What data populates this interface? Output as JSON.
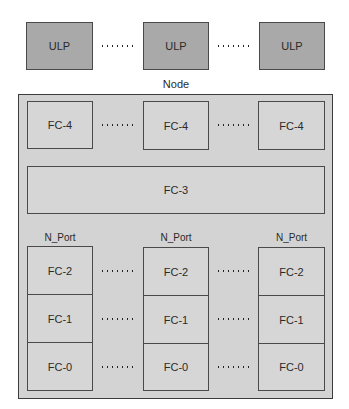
{
  "diagram": {
    "ulp_row": [
      {
        "label": "ULP"
      },
      {
        "label": "ULP"
      },
      {
        "label": "ULP"
      }
    ],
    "node_label": "Node",
    "fc4_row": [
      {
        "label": "FC-4"
      },
      {
        "label": "FC-4"
      },
      {
        "label": "FC-4"
      }
    ],
    "fc3": {
      "label": "FC-3"
    },
    "ports": [
      {
        "name": "N_Port",
        "layers": [
          "FC-2",
          "FC-1",
          "FC-0"
        ]
      },
      {
        "name": "N_Port",
        "layers": [
          "FC-2",
          "FC-1",
          "FC-0"
        ]
      },
      {
        "name": "N_Port",
        "layers": [
          "FC-2",
          "FC-1",
          "FC-0"
        ]
      }
    ],
    "colors": {
      "ulp_fill": "#a9a9a9",
      "node_fill": "#d3d3d3",
      "inner_fill": "#d6d6d6",
      "border": "#4a4a4a"
    }
  }
}
